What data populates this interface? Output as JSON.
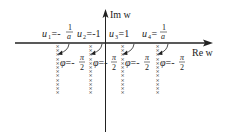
{
  "axes": {
    "x_label": "Re w",
    "y_label": "Im w"
  },
  "points": [
    {
      "name": "u1",
      "label": "u",
      "sub": "1",
      "eq": "=-",
      "value": "1/a",
      "num": "1",
      "den": "a",
      "phi": "φ=-π/2"
    },
    {
      "name": "u2",
      "label": "u",
      "sub": "2",
      "eq": "=-1",
      "value": "-1",
      "phi": "φ=-π/2"
    },
    {
      "name": "u3",
      "label": "u",
      "sub": "3",
      "eq": "=1",
      "value": "1",
      "phi": "φ=-π/2"
    },
    {
      "name": "u4",
      "label": "u",
      "sub": "4",
      "eq": "=",
      "value": "1/a",
      "num": "1",
      "den": "a",
      "phi": "φ=-π/2"
    }
  ],
  "phi_text": {
    "phi": "φ",
    "eq": "=-",
    "num": "π",
    "den": "2"
  },
  "cross_glyph": "×",
  "colors": {
    "ink": "#222222",
    "background": "#ffffff"
  }
}
